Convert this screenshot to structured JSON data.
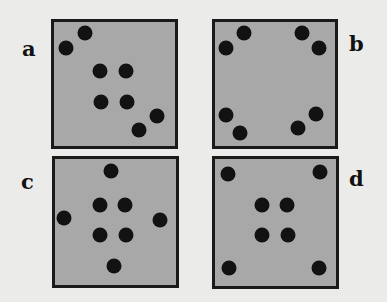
{
  "figure": {
    "background_color": "#ebebea",
    "panel_fill_color": "#a8a8a8",
    "panel_border_color": "#1a1a1a",
    "dot_color": "#121212",
    "panels": [
      {
        "id": "a",
        "label": "a",
        "label_pos": [
          22,
          38
        ],
        "box": [
          51,
          19,
          127,
          130
        ],
        "dots": [
          [
            85,
            33
          ],
          [
            66,
            48
          ],
          [
            100,
            71
          ],
          [
            126,
            71
          ],
          [
            101,
            102
          ],
          [
            127,
            102
          ],
          [
            157,
            116
          ],
          [
            139,
            130
          ]
        ]
      },
      {
        "id": "b",
        "label": "b",
        "label_pos": [
          349,
          33
        ],
        "box": [
          212,
          19,
          126,
          130
        ],
        "dots": [
          [
            244,
            33
          ],
          [
            302,
            33
          ],
          [
            226,
            48
          ],
          [
            319,
            48
          ],
          [
            226,
            115
          ],
          [
            316,
            114
          ],
          [
            240,
            133
          ],
          [
            298,
            128
          ]
        ]
      },
      {
        "id": "c",
        "label": "c",
        "label_pos": [
          21,
          171
        ],
        "box": [
          52,
          156,
          127,
          132
        ],
        "dots": [
          [
            111,
            171
          ],
          [
            100,
            205
          ],
          [
            125,
            205
          ],
          [
            64,
            218
          ],
          [
            160,
            220
          ],
          [
            100,
            235
          ],
          [
            126,
            235
          ],
          [
            114,
            266
          ]
        ]
      },
      {
        "id": "d",
        "label": "d",
        "label_pos": [
          349,
          168
        ],
        "box": [
          212,
          156,
          127,
          133
        ],
        "dots": [
          [
            228,
            174
          ],
          [
            320,
            172
          ],
          [
            262,
            205
          ],
          [
            287,
            205
          ],
          [
            262,
            235
          ],
          [
            288,
            235
          ],
          [
            229,
            268
          ],
          [
            319,
            268
          ]
        ]
      }
    ]
  }
}
